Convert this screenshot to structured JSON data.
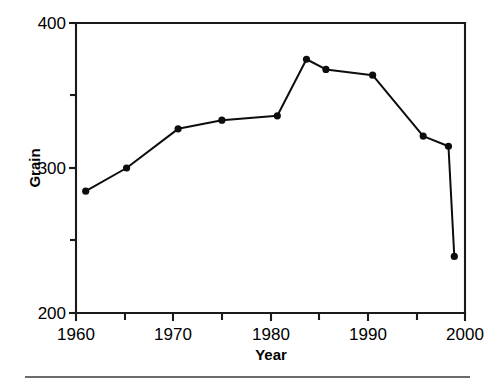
{
  "chart_data": {
    "type": "line",
    "title": "",
    "xlabel": "Year",
    "ylabel": "Grain",
    "xlim": [
      1960,
      2000
    ],
    "ylim": [
      200,
      400
    ],
    "grid": false,
    "legend": null,
    "x_major_ticks": [
      1960,
      1970,
      1980,
      1990,
      2000
    ],
    "x_major_tick_labels": [
      "1960",
      "1970",
      "1980",
      "1990",
      "2000"
    ],
    "x_minor_ticks": [
      1965,
      1975,
      1985,
      1995
    ],
    "y_major_ticks": [
      200,
      300,
      400
    ],
    "y_major_tick_labels": [
      "200",
      "300",
      "400"
    ],
    "y_minor_ticks": [
      250,
      350
    ],
    "series": [
      {
        "name": "Grain",
        "marker": "circle",
        "x": [
          1961.0,
          1965.2,
          1970.5,
          1975.0,
          1980.7,
          1983.7,
          1985.7,
          1990.5,
          1995.7,
          1998.3,
          1998.9
        ],
        "values": [
          284,
          300,
          327,
          333,
          336,
          375,
          368,
          364,
          322,
          315,
          239
        ]
      }
    ]
  },
  "axes": {
    "y_label": "Grain",
    "x_label": "Year",
    "y_ticks": [
      "400",
      "300",
      "200"
    ],
    "x_ticks": [
      "1960",
      "1970",
      "1980",
      "1990",
      "2000"
    ]
  },
  "colors": {
    "line": "#0d0d0d",
    "marker": "#0d0d0d",
    "axis": "#1a1a1a",
    "background": "#ffffff",
    "footer_rule": "#3a3a3a"
  }
}
